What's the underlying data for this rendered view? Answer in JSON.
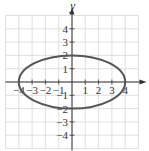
{
  "chart_data": {
    "type": "line",
    "title": "",
    "xlabel": "x",
    "ylabel": "y",
    "xlim": [
      -5,
      5
    ],
    "ylim": [
      -5,
      5
    ],
    "grid": true,
    "x_ticks": [
      -4,
      -3,
      -2,
      -1,
      1,
      2,
      3,
      4
    ],
    "y_ticks": [
      -4,
      -3,
      -2,
      -1,
      1,
      2,
      3,
      4
    ],
    "x_tick_labels": [
      "-4",
      "-3",
      "-2",
      "-1",
      "1",
      "2",
      "3",
      "4"
    ],
    "y_tick_labels": [
      "-4",
      "-3",
      "-2",
      "-1",
      "1",
      "2",
      "3",
      "4"
    ],
    "series": [
      {
        "name": "ellipse",
        "equation": "x^2/16 + y^2/4 = 1",
        "center": [
          0,
          0
        ],
        "semi_axis_x": 4,
        "semi_axis_y": 2,
        "points": [
          [
            -4,
            0
          ],
          [
            0,
            2
          ],
          [
            4,
            0
          ],
          [
            0,
            -2
          ]
        ]
      }
    ],
    "colors": {
      "curve": "#555555",
      "grid": "#d8d8d8",
      "axis": "#333333"
    }
  }
}
